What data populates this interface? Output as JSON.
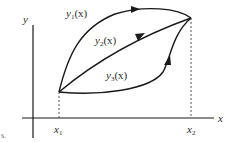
{
  "diagram": {
    "axes": {
      "x_label": "x",
      "y_label": "y"
    },
    "points": {
      "start_label_base": "x",
      "start_label_sub": "1",
      "end_label_base": "x",
      "end_label_sub": "2"
    },
    "curves": [
      {
        "id": "y1",
        "base": "y",
        "sub": "1",
        "arg": "(x)",
        "shape": "upper arc, rising steeply then bowing over to the end point"
      },
      {
        "id": "y2",
        "base": "y",
        "sub": "2",
        "arg": "(x)",
        "shape": "nearly straight line from start to end point"
      },
      {
        "id": "y3",
        "base": "y",
        "sub": "3",
        "arg": "(x)",
        "shape": "lower curve, flat then rising sharply to end point"
      }
    ],
    "stray_mark": "s."
  }
}
